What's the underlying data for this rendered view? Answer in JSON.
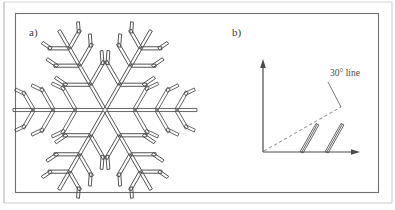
{
  "figure": {
    "title": "",
    "background_color": "#ffffff",
    "outer_frame_color": "#b9b9b9",
    "panel_border_color": "#6f6f6f",
    "line_color": "#4a4a4a",
    "dashed_line_color": "#9a9a9a",
    "width": 395,
    "height": 210
  },
  "panels": [
    {
      "id": "panel-a",
      "caption": "a)",
      "content": "snowflake-dendrite-schematic",
      "snowflake": {
        "arm_count": 6,
        "center_x": 105,
        "center_y": 110,
        "arm_length": 92,
        "rod_width": 3.1,
        "branch_angle_deg": 60,
        "branch_positions": [
          0.3,
          0.52,
          0.74
        ],
        "branch_lengths": [
          27,
          25,
          21
        ],
        "tip_fork_length": 14,
        "arm_angles_deg": [
          0,
          60,
          120,
          180,
          240,
          300
        ]
      }
    },
    {
      "id": "panel-b",
      "caption": "b)",
      "content": "axes-with-30-degree-line-and-rods",
      "annotation_label": "30° line",
      "axes": {
        "origin_x": 263,
        "origin_y": 152,
        "x_axis_end_x": 358,
        "y_axis_end_y": 62,
        "arrowheads": true
      },
      "reference_line": {
        "label": "30° line",
        "angle_deg": 30,
        "style": "dashed",
        "start_x": 263,
        "start_y": 152,
        "end_x": 340,
        "end_y": 108
      },
      "leader_line": {
        "from_x": 340,
        "from_y": 108,
        "to_x": 327,
        "to_y": 83
      },
      "rods": [
        {
          "base_x": 302,
          "tip_x": 316,
          "tip_y": 124,
          "angle_deg": 52
        },
        {
          "base_x": 327,
          "tip_x": 341,
          "tip_y": 124,
          "angle_deg": 52
        }
      ]
    }
  ]
}
